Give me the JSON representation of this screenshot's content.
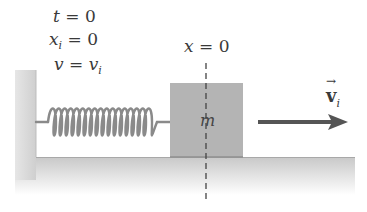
{
  "initial_conditions": {
    "t": {
      "var": "t",
      "sub": "",
      "eq": " = ",
      "val": "0"
    },
    "x": {
      "var": "x",
      "sub": "i",
      "eq": " = ",
      "val": "0"
    },
    "v": {
      "var": "v",
      "sub": "",
      "eq": " = ",
      "val": "v",
      "val_sub": "i"
    }
  },
  "origin_label": {
    "var": "x",
    "eq": " = ",
    "val": "0"
  },
  "block": {
    "label": "m",
    "color": "#b4b4b4"
  },
  "velocity": {
    "symbol": "v",
    "sub": "i",
    "arrow": "→"
  },
  "colors": {
    "wall": "#d0d0d0",
    "floor": "#d4d4d4",
    "spring": "#8a8a8a",
    "arrow": "#555555",
    "dashed_line": "#444444"
  }
}
